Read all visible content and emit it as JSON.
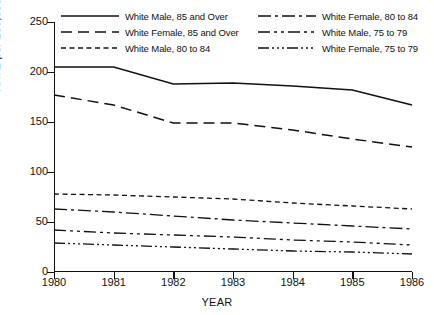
{
  "chart_data": {
    "type": "line",
    "title": "",
    "xlabel": "YEAR",
    "ylabel": "RATE per 100,000",
    "x": [
      1980,
      1981,
      1982,
      1983,
      1984,
      1985,
      1986
    ],
    "xticklabels": [
      "1980",
      "1981",
      "1982",
      "1983",
      "1984",
      "1985",
      "1986"
    ],
    "xlim": [
      1980,
      1986
    ],
    "ylim": [
      0,
      250
    ],
    "yticks": [
      0,
      50,
      100,
      150,
      200,
      250
    ],
    "yticklabels": [
      "0",
      "50",
      "100",
      "150",
      "200",
      "250"
    ],
    "grid": false,
    "legend_position": "top",
    "series": [
      {
        "name": "White Male, 85 and Over",
        "dash": "solid",
        "values": [
          205,
          205,
          188,
          189,
          186,
          182,
          167
        ]
      },
      {
        "name": "White Female, 85 and Over",
        "dash": "long-dash",
        "values": [
          177,
          167,
          149,
          149,
          142,
          133,
          125
        ]
      },
      {
        "name": "White Male, 80 to 84",
        "dash": "short-dash",
        "values": [
          78,
          77,
          75,
          73,
          69,
          66,
          63
        ]
      },
      {
        "name": "White Female, 80 to 84",
        "dash": "dash-dot",
        "values": [
          63,
          60,
          56,
          52,
          49,
          46,
          43
        ]
      },
      {
        "name": "White Male, 75 to 79",
        "dash": "dash-dot-dot",
        "values": [
          42,
          39,
          37,
          35,
          32,
          30,
          27
        ]
      },
      {
        "name": "White Female, 75 to 79",
        "dash": "dash-triple-dot",
        "values": [
          29,
          27,
          25,
          23,
          21,
          20,
          18
        ]
      }
    ]
  },
  "legend": {
    "left_column": [
      {
        "label": "White Male, 85 and Over",
        "dash": "solid"
      },
      {
        "label": "White Female, 85 and Over",
        "dash": "long-dash"
      },
      {
        "label": "White Male, 80 to 84",
        "dash": "short-dash"
      }
    ],
    "right_column": [
      {
        "label": "White Female, 80 to 84",
        "dash": "dash-dot"
      },
      {
        "label": "White Male, 75 to 79",
        "dash": "dash-dot-dot"
      },
      {
        "label": "White Female, 75 to 79",
        "dash": "dash-triple-dot"
      }
    ]
  },
  "colors": {
    "ink": "#111111",
    "background": "#ffffff"
  }
}
